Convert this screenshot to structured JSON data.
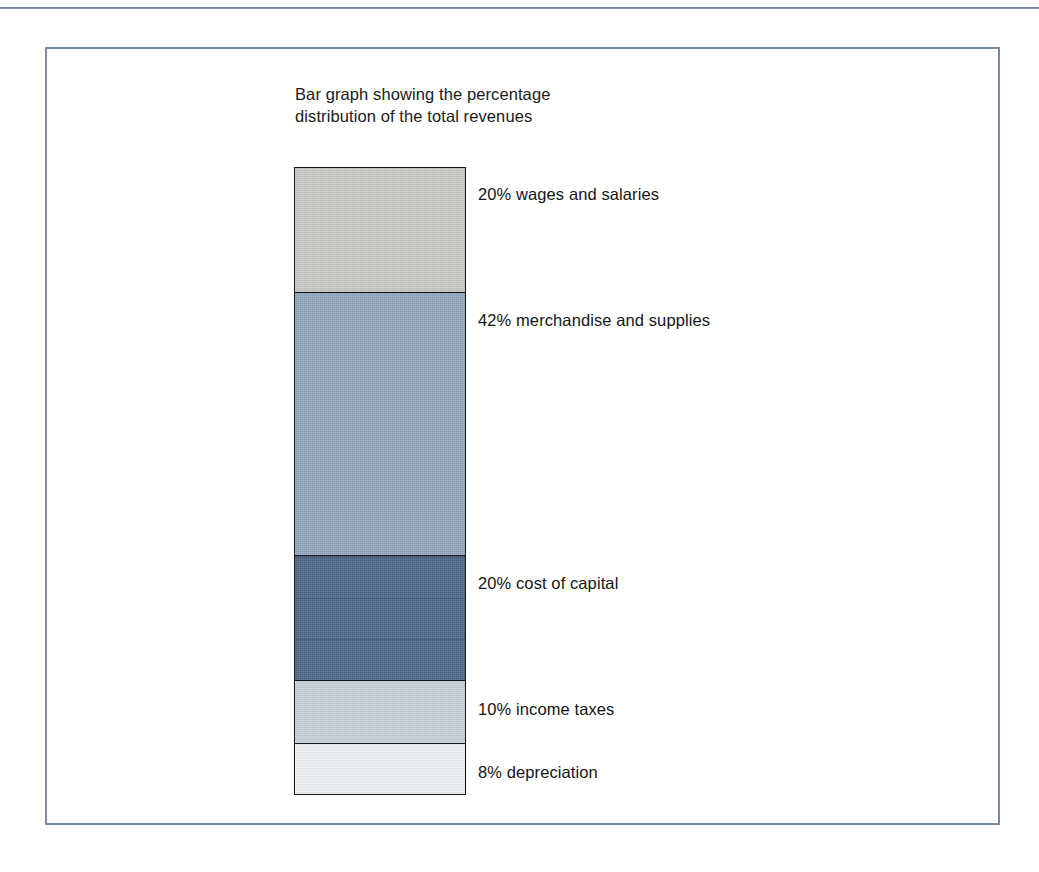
{
  "figure": {
    "caption_line_1": "Bar graph showing the percentage",
    "caption_line_2": "distribution of the total revenues"
  },
  "chart_data": {
    "type": "bar",
    "orientation": "vertical-stacked",
    "title": "Bar graph showing the percentage distribution of the total revenues",
    "xlabel": "",
    "ylabel": "",
    "unit": "percent",
    "total": 100,
    "legend_position": "right-of-bar",
    "grid": false,
    "categories": [
      "wages and salaries",
      "merchandise and supplies",
      "cost of capital",
      "income taxes",
      "depreciation"
    ],
    "values": [
      20,
      42,
      20,
      10,
      8
    ],
    "labels": [
      "20% wages and salaries",
      "42% merchandise and supplies",
      "20% cost of capital",
      "10% income taxes",
      "8% depreciation"
    ],
    "segments": [
      {
        "label": "20% wages and salaries",
        "percent": 20,
        "category": "wages and salaries",
        "color": "#c9c9c4",
        "banded": false
      },
      {
        "label": "42% merchandise and supplies",
        "percent": 42,
        "category": "merchandise and supplies",
        "color": "#93a8be",
        "banded": false
      },
      {
        "label": "20% cost of capital",
        "percent": 20,
        "category": "cost of capital",
        "color": "#4a6788",
        "banded": true
      },
      {
        "label": "10% income taxes",
        "percent": 10,
        "category": "income taxes",
        "color": "#c8d2dc",
        "banded": false
      },
      {
        "label": "8% depreciation",
        "percent": 8,
        "category": "depreciation",
        "color": "#eef2f5",
        "banded": false
      }
    ]
  },
  "style": {
    "frame_color": "#7b8ca6",
    "outline_color": "#161616",
    "page_background": "#ffffff",
    "text_color": "#151515"
  }
}
